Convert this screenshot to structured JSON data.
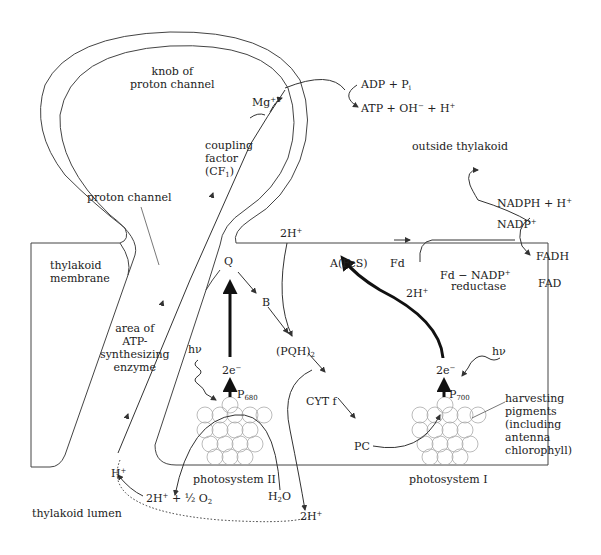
{
  "diagram": {
    "regions": {
      "knob": "knob of\nproton channel",
      "proton_channel": "proton channel",
      "coupling_factor": "coupling\nfactor\n(CF",
      "coupling_factor_sub": "1",
      "coupling_factor_end": ")",
      "outside": "outside thylakoid",
      "membrane": "thylakoid\nmembrane",
      "atp_area": "area of\nATP-\nsynthesizing\nenzyme",
      "lumen": "thylakoid lumen",
      "ps2": "photosystem II",
      "ps1": "photosystem I",
      "harvesting": "harvesting\npigments\n(including\nantenna\nchlorophyll)"
    },
    "species": {
      "mg": "Mg",
      "mg_sup": "+2",
      "adp": "ADP + P",
      "adp_sub": "i",
      "atp": "ATP + OH",
      "atp_sup1": "−",
      "atp_mid": " + H",
      "atp_sup2": "+",
      "nadph": "NADPH + H",
      "nadph_sup": "+",
      "nadp": "NADP",
      "nadp_sup": "+",
      "fadh": "FADH",
      "fad": "FAD",
      "fd_nadp": "Fd − NADP",
      "fd_nadp_sup": "+",
      "reductase": "reductase",
      "afes": "A(FeS)",
      "fd": "Fd",
      "twoH_fd": "2H",
      "twoH_fd_sup": "+",
      "twoH_top": "2H",
      "twoH_top_sup": "+",
      "q": "Q",
      "b": "B",
      "pqh": "(PQH)",
      "pqh_sub": "2",
      "cyt": "CYT f",
      "pc": "PC",
      "hv1": "hν",
      "hv2": "hν",
      "e2a": "2e",
      "e2a_sup": "−",
      "e2b": "2e",
      "e2b_sup": "−",
      "p680": "P",
      "p680_sub": "680",
      "p700": "P",
      "p700_sub": "700",
      "hplus": "H",
      "hplus_sup": "+",
      "water_split": "2H",
      "water_split_sup": "+",
      "water_split_end": " + ½ O",
      "water_split_sub": "2",
      "h2o": "H",
      "h2o_sub": "2",
      "h2o_end": "O",
      "twoH_lumen": "2H",
      "twoH_lumen_sup": "+"
    },
    "colors": {
      "line": "#333333",
      "circle": "#aaaaaa",
      "background": "#ffffff"
    }
  }
}
